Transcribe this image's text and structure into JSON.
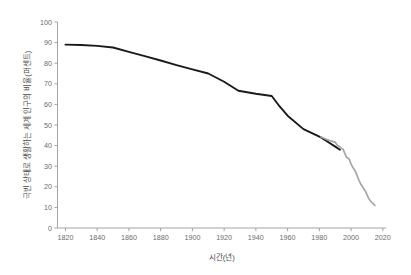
{
  "chart_data": {
    "type": "line",
    "title": "",
    "xlabel": "시간(년)",
    "ylabel": "극빈 상태로 생활하는 세계 인구의 비율(퍼센트)",
    "xlim": [
      1815,
      2022
    ],
    "ylim": [
      0,
      100
    ],
    "grid": false,
    "legend": "none",
    "xticks": [
      1820,
      1840,
      1860,
      1880,
      1900,
      1920,
      1940,
      1960,
      1980,
      2000,
      2020
    ],
    "xtick_labels": [
      "1820",
      "1840",
      "1860",
      "1880",
      "1900",
      "1920",
      "1940",
      "1960",
      "1980",
      "2000",
      "2020"
    ],
    "yticks": [
      0,
      10,
      20,
      30,
      40,
      50,
      60,
      70,
      80,
      90,
      100
    ],
    "ytick_labels": [
      "0",
      "10",
      "20",
      "30",
      "40",
      "50",
      "60",
      "70",
      "80",
      "90",
      "100"
    ],
    "series": [
      {
        "name": "historical-estimate",
        "color": "#1a1a1a",
        "width": 1.9,
        "points": [
          [
            1820,
            89.0
          ],
          [
            1830,
            88.8
          ],
          [
            1840,
            88.4
          ],
          [
            1850,
            87.6
          ],
          [
            1860,
            85.5
          ],
          [
            1870,
            83.4
          ],
          [
            1880,
            81.3
          ],
          [
            1890,
            79.1
          ],
          [
            1900,
            77.0
          ],
          [
            1910,
            75.0
          ],
          [
            1920,
            71.0
          ],
          [
            1929,
            66.6
          ],
          [
            1940,
            65.2
          ],
          [
            1950,
            64.1
          ],
          [
            1955,
            59.0
          ],
          [
            1960,
            54.5
          ],
          [
            1970,
            48.0
          ],
          [
            1981,
            44.0
          ],
          [
            1985,
            42.0
          ],
          [
            1990,
            39.5
          ],
          [
            1993,
            38.0
          ]
        ]
      },
      {
        "name": "survey-based-estimate",
        "color": "#a6a6a6",
        "width": 1.7,
        "points": [
          [
            1981,
            44.2
          ],
          [
            1984,
            43.2
          ],
          [
            1987,
            42.3
          ],
          [
            1990,
            41.7
          ],
          [
            1991,
            40.5
          ],
          [
            1992,
            39.8
          ],
          [
            1993,
            39.4
          ],
          [
            1994,
            38.6
          ],
          [
            1995,
            38.2
          ],
          [
            1996,
            36.3
          ],
          [
            1997,
            34.5
          ],
          [
            1998,
            34.0
          ],
          [
            1999,
            33.2
          ],
          [
            2000,
            31.0
          ],
          [
            2001,
            29.5
          ],
          [
            2002,
            28.4
          ],
          [
            2003,
            27.0
          ],
          [
            2004,
            25.0
          ],
          [
            2005,
            23.0
          ],
          [
            2006,
            21.5
          ],
          [
            2007,
            20.3
          ],
          [
            2008,
            19.0
          ],
          [
            2009,
            18.0
          ],
          [
            2010,
            16.2
          ],
          [
            2011,
            14.5
          ],
          [
            2012,
            13.3
          ],
          [
            2013,
            12.5
          ],
          [
            2015,
            11.0
          ]
        ]
      }
    ]
  },
  "axis": {
    "y_title": "극빈 상태로 생활하는 세계 인구의 비율(퍼센트)",
    "x_title": "시간(년)"
  },
  "colors": {
    "series_primary": "#1a1a1a",
    "series_secondary": "#a6a6a6",
    "axis": "#9a9a9a",
    "tick_text": "#6b6b6b",
    "background": "#ffffff"
  }
}
